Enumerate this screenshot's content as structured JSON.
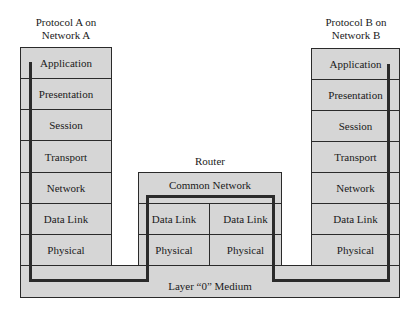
{
  "colors": {
    "fill": "#d6d6d6",
    "stroke": "#2a2a2a",
    "path": "#2b2b2b"
  },
  "left": {
    "caption_line1": "Protocol A on",
    "caption_line2": "Network A",
    "layers": [
      "Application",
      "Presentation",
      "Session",
      "Transport",
      "Network",
      "Data Link",
      "Physical"
    ]
  },
  "right": {
    "caption_line1": "Protocol B on",
    "caption_line2": "Network B",
    "layers": [
      "Application",
      "Presentation",
      "Session",
      "Transport",
      "Network",
      "Data Link",
      "Physical"
    ]
  },
  "router": {
    "caption": "Router",
    "common": "Common Network",
    "left_datalink": "Data Link",
    "right_datalink": "Data Link",
    "left_physical": "Physical",
    "right_physical": "Physical"
  },
  "medium": {
    "label": "Layer “0” Medium"
  }
}
